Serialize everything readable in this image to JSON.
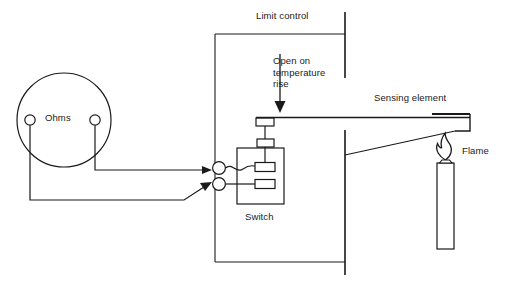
{
  "diagram": {
    "title_label": "Limit control",
    "labels": {
      "limit_control": "Limit control",
      "open_on_temperature_rise": "Open on\ntemperature\nrise",
      "sensing_element": "Sensing element",
      "flame": "Flame",
      "ohms": "Ohms",
      "switch": "Switch"
    },
    "colors": {
      "line": "#1a1a1a",
      "text": "#1a1a1a",
      "background": "#ffffff"
    },
    "components": [
      {
        "name": "ohmmeter",
        "label": "Ohms",
        "terminals": 2
      },
      {
        "name": "limit-control-enclosure",
        "label": "Limit control"
      },
      {
        "name": "switch-assembly",
        "label": "Switch",
        "contacts": 2
      },
      {
        "name": "bimetal-sensing-element",
        "label": "Sensing element"
      },
      {
        "name": "burner-flame",
        "label": "Flame"
      }
    ],
    "annotations": [
      {
        "name": "open-on-temperature-rise-arrow",
        "text": "Open on temperature rise",
        "direction": "down"
      }
    ]
  }
}
